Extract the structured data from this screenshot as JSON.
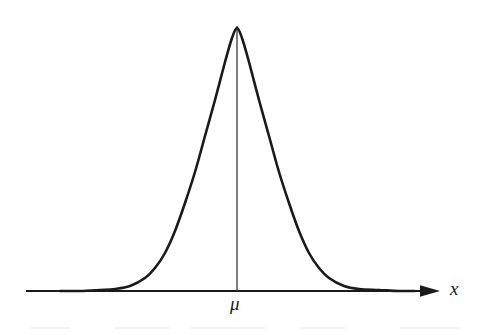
{
  "figure": {
    "type": "diagram",
    "title": "",
    "background_color": "#ffffff",
    "stroke_color": "#1a1a1a"
  },
  "labels": {
    "x_axis": "x",
    "mean": "μ"
  },
  "icons": {
    "arrow": "arrow-right-icon"
  },
  "chart_data": {
    "type": "line",
    "title": "",
    "xlabel": "x",
    "ylabel": "",
    "grid": false,
    "legend": null,
    "annotations": [
      {
        "text": "μ",
        "x": 237,
        "y": 303,
        "meaning": "mean-marker-label"
      },
      {
        "text": "x",
        "x": 455,
        "y": 289,
        "meaning": "x-axis-name"
      }
    ],
    "axis": {
      "x_start_px": 26,
      "x_end_px": 440,
      "baseline_y_px": 291,
      "has_arrowhead": true
    },
    "curve": {
      "name": "normal-distribution",
      "peak_x_px": 237,
      "peak_y_px": 28,
      "left_tail_x_px": 60,
      "right_tail_x_px": 415,
      "sigma_px": 38,
      "points": [
        [
          60,
          291
        ],
        [
          80,
          291
        ],
        [
          100,
          290
        ],
        [
          115,
          289
        ],
        [
          130,
          286
        ],
        [
          145,
          278
        ],
        [
          155,
          268
        ],
        [
          165,
          253
        ],
        [
          175,
          231
        ],
        [
          185,
          203
        ],
        [
          195,
          172
        ],
        [
          205,
          136
        ],
        [
          215,
          100
        ],
        [
          225,
          62
        ],
        [
          232,
          38
        ],
        [
          237,
          28
        ],
        [
          242,
          38
        ],
        [
          249,
          62
        ],
        [
          259,
          100
        ],
        [
          269,
          136
        ],
        [
          279,
          172
        ],
        [
          289,
          203
        ],
        [
          299,
          231
        ],
        [
          309,
          253
        ],
        [
          319,
          268
        ],
        [
          329,
          278
        ],
        [
          344,
          286
        ],
        [
          359,
          289
        ],
        [
          379,
          290
        ],
        [
          399,
          291
        ],
        [
          415,
          291
        ]
      ]
    },
    "vertical_marker": {
      "x_px": 237,
      "y_top_px": 26,
      "y_bottom_px": 291
    }
  }
}
